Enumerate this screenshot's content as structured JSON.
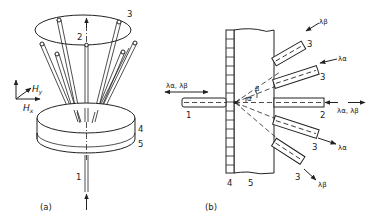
{
  "figure": {
    "panel_a": {
      "caption": "(a)",
      "labels": {
        "input_fiber": "1",
        "center_fiber": "2",
        "output_fibers": "3",
        "layer_top": "4",
        "layer_bottom": "5"
      },
      "axes": {
        "x": "Hx",
        "y": "Hy"
      }
    },
    "panel_b": {
      "caption": "(b)",
      "labels": {
        "input_fiber": "1",
        "through_fiber": "2",
        "output_fiber": "3",
        "grating": "4",
        "substrate": "5"
      },
      "angles": {
        "alpha": "α",
        "beta": "β"
      },
      "wavelengths": {
        "input": "λα, λβ",
        "through": "λα, λβ",
        "upper_outer": "λβ",
        "upper_inner": "λα",
        "lower_inner": "λα",
        "lower_outer": "λβ"
      }
    }
  }
}
